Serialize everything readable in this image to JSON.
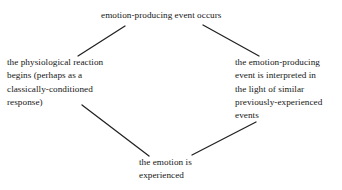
{
  "diagram": {
    "background_color": "#ffffff",
    "text_color": "#161616",
    "connector_color": "#222222",
    "nodes": {
      "top": {
        "id": "emotion-producing-event",
        "text": "emotion-producing event occurs"
      },
      "left": {
        "id": "physiological-reaction",
        "text": "the physiological reaction\nbegins (perhaps as a\nclassically-conditioned\nresponse)"
      },
      "right": {
        "id": "event-interpretation",
        "text": "the emotion-producing\nevent is interpreted in\nthe light of similar\npreviously-experienced\nevents"
      },
      "bottom": {
        "id": "emotion-experienced",
        "text": "the emotion is\nexperienced"
      }
    },
    "connectors": [
      {
        "id": "top-to-left",
        "from": "emotion-producing-event",
        "to": "physiological-reaction",
        "x1": 125,
        "y1": 26,
        "x2": 78,
        "y2": 56
      },
      {
        "id": "top-to-right",
        "from": "emotion-producing-event",
        "to": "event-interpretation",
        "x1": 203,
        "y1": 25,
        "x2": 259,
        "y2": 56
      },
      {
        "id": "left-to-bottom",
        "from": "physiological-reaction",
        "to": "emotion-experienced",
        "x1": 82,
        "y1": 105,
        "x2": 149,
        "y2": 156
      },
      {
        "id": "right-to-bottom",
        "from": "event-interpretation",
        "to": "emotion-experienced",
        "x1": 256,
        "y1": 122,
        "x2": 192,
        "y2": 155
      }
    ]
  }
}
